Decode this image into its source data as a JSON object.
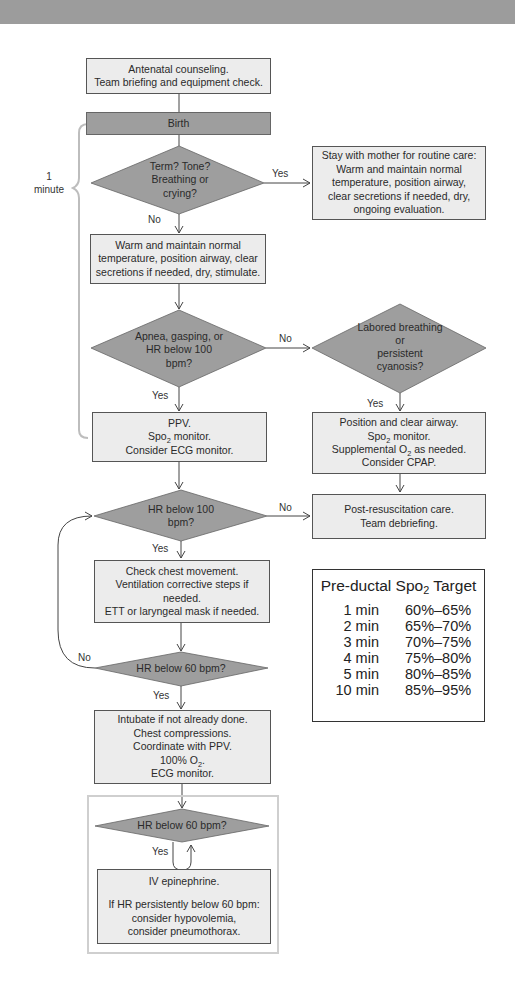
{
  "header_band": {
    "color": "#9c9c9c"
  },
  "colors": {
    "box_fill": "#ececec",
    "decision_fill": "#9e9e9e",
    "stroke": "#555555",
    "bracket": "#bdbdbd"
  },
  "bracket": {
    "line1": "1",
    "line2": "minute"
  },
  "nodes": {
    "antenatal": {
      "lines": [
        "Antenatal counseling.",
        "Team briefing and equipment check."
      ]
    },
    "birth": {
      "lines": [
        "Birth"
      ]
    },
    "decision_term": {
      "lines": [
        "Term? Tone?",
        "Breathing or",
        "crying?"
      ]
    },
    "routine_care": {
      "lines": [
        "Stay with mother for routine care:",
        "Warm and maintain normal",
        "temperature, position airway,",
        "clear secretions if needed, dry,",
        "ongoing evaluation."
      ]
    },
    "warm": {
      "lines": [
        "Warm and maintain normal",
        "temperature, position airway, clear",
        "secretions if needed, dry, stimulate."
      ]
    },
    "decision_apnea": {
      "lines": [
        "Apnea, gasping, or",
        "HR below 100",
        "bpm?"
      ]
    },
    "decision_labored": {
      "lines": [
        "Labored breathing",
        "or",
        "persistent",
        "cyanosis?"
      ]
    },
    "ppv": {
      "lines": [
        "PPV.",
        "Spo2 monitor.",
        "Consider ECG monitor."
      ],
      "line1_main": "Spo",
      "line1_sub": "2",
      "line1_rest": " monitor."
    },
    "position": {
      "l1": "Position and clear airway.",
      "l2_main": "Spo",
      "l2_sub": "2",
      "l2_rest": " monitor.",
      "l3_main": "Supplemental O",
      "l3_sub": "2",
      "l3_rest": " as needed.",
      "l4": "Consider CPAP."
    },
    "decision_hr100": {
      "lines": [
        "HR below 100",
        "bpm?"
      ]
    },
    "post_resus": {
      "lines": [
        "Post-resuscitation care.",
        "Team debriefing."
      ]
    },
    "check_chest": {
      "lines": [
        "Check chest movement.",
        "Ventilation corrective steps if",
        "needed.",
        "ETT or laryngeal mask if needed."
      ]
    },
    "decision_hr60": {
      "lines": [
        "HR below 60 bpm?"
      ]
    },
    "intubate": {
      "l1": "Intubate if not already done.",
      "l2": "Chest compressions.",
      "l3": "Coordinate with PPV.",
      "l4_main": "100% O",
      "l4_sub": "2",
      "l4_rest": ".",
      "l5": "ECG monitor."
    },
    "decision_hr60_b": {
      "lines": [
        "HR below 60 bpm?"
      ]
    },
    "epinephrine": {
      "lines": [
        "IV epinephrine.",
        "",
        "If HR persistently below 60 bpm:",
        "consider hypovolemia,",
        "consider pneumothorax."
      ]
    }
  },
  "edge_labels": {
    "term_yes": "Yes",
    "term_no": "No",
    "apnea_no": "No",
    "apnea_yes": "Yes",
    "labored_yes": "Yes",
    "hr100_no": "No",
    "hr100_yes": "Yes",
    "hr60_no": "No",
    "hr60_yes": "Yes",
    "hr60b_yes": "Yes"
  },
  "spo2_target": {
    "title_main": "Pre-ductal Spo",
    "title_sub": "2",
    "title_rest": " Target",
    "rows": [
      {
        "time": "1 min",
        "range": "60%–65%"
      },
      {
        "time": "2 min",
        "range": "65%–70%"
      },
      {
        "time": "3 min",
        "range": "70%–75%"
      },
      {
        "time": "4 min",
        "range": "75%–80%"
      },
      {
        "time": "5 min",
        "range": "80%–85%"
      },
      {
        "time": "10 min",
        "range": "85%–95%"
      }
    ]
  }
}
